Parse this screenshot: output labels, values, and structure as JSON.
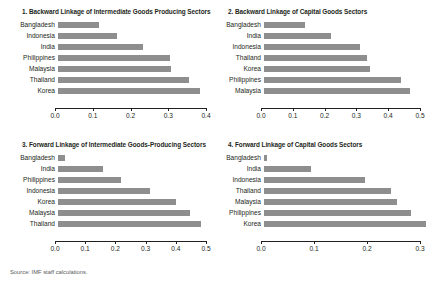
{
  "source_note": "Source: IMF staff calculations.",
  "bar_color": "#8e8e8e",
  "axis_color": "#231f20",
  "chart_data": [
    {
      "type": "bar",
      "orientation": "horizontal",
      "title": "1. Backward Linkage of Intermediate Goods Producing Sectors",
      "categories": [
        "Bangladesh",
        "Indonesia",
        "India",
        "Philippines",
        "Malaysia",
        "Thailand",
        "Korea"
      ],
      "values": [
        0.105,
        0.152,
        0.219,
        0.288,
        0.289,
        0.335,
        0.365
      ],
      "xlabel": "",
      "ylabel": "",
      "xlim": [
        0.0,
        0.4
      ],
      "xticks": [
        0.0,
        0.1,
        0.2,
        0.3,
        0.4
      ],
      "xticklabels": [
        "0.0",
        "0.1",
        "0.2",
        "0.3",
        "0.4"
      ],
      "grid": false,
      "legend": "none"
    },
    {
      "type": "bar",
      "orientation": "horizontal",
      "title": "2. Backward Linkage of Capital Goods Sectors",
      "categories": [
        "Bangladesh",
        "India",
        "Indonesia",
        "Thailand",
        "Korea",
        "Philippines",
        "Malaysia"
      ],
      "values": [
        0.126,
        0.203,
        0.292,
        0.313,
        0.322,
        0.418,
        0.445
      ],
      "xlabel": "",
      "ylabel": "",
      "xlim": [
        0.0,
        0.5
      ],
      "xticks": [
        0.0,
        0.1,
        0.2,
        0.3,
        0.4,
        0.5
      ],
      "xticklabels": [
        "0.0",
        "0.1",
        "0.2",
        "0.3",
        "0.4",
        "0.5"
      ],
      "grid": false,
      "legend": "none"
    },
    {
      "type": "bar",
      "orientation": "horizontal",
      "title": "3. Forward Linkage of Intermediate Goods-Producing Sectors",
      "categories": [
        "Bangladesh",
        "India",
        "Philippines",
        "Indonesia",
        "Korea",
        "Malaysia",
        "Thailand"
      ],
      "values": [
        0.021,
        0.145,
        0.203,
        0.296,
        0.377,
        0.422,
        0.458
      ],
      "xlabel": "",
      "ylabel": "",
      "xlim": [
        0.0,
        0.5
      ],
      "xticks": [
        0.0,
        0.1,
        0.2,
        0.3,
        0.4,
        0.5
      ],
      "xticklabels": [
        "0.0",
        "0.1",
        "0.2",
        "0.3",
        "0.4",
        "0.5"
      ],
      "grid": false,
      "legend": "none"
    },
    {
      "type": "bar",
      "orientation": "horizontal",
      "title": "4. Forward Linkage of Capital Goods Sectors",
      "categories": [
        "Bangladesh",
        "India",
        "Indonesia",
        "Thailand",
        "Malaysia",
        "Philippines",
        "Korea"
      ],
      "values": [
        0.006,
        0.086,
        0.184,
        0.233,
        0.244,
        0.268,
        0.297
      ],
      "xlabel": "",
      "ylabel": "",
      "xlim": [
        0.0,
        0.3
      ],
      "xticks": [
        0.0,
        0.1,
        0.2,
        0.3
      ],
      "xticklabels": [
        "0.0",
        "0.1",
        "0.2",
        "0.3"
      ],
      "grid": false,
      "legend": "none"
    }
  ]
}
